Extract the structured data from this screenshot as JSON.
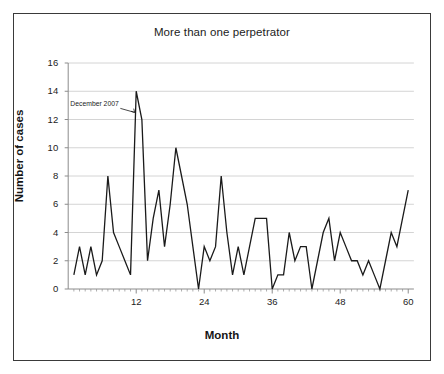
{
  "chart_data": {
    "type": "line",
    "title": "More than one perpetrator",
    "xlabel": "Month",
    "ylabel": "Number of cases",
    "xlim": [
      0,
      61
    ],
    "ylim": [
      0,
      16
    ],
    "xticks": [
      12,
      24,
      36,
      48,
      60
    ],
    "xtick_labels": [
      "12",
      "24",
      "36",
      "48",
      "60"
    ],
    "yticks": [
      0,
      2,
      4,
      6,
      8,
      10,
      12,
      14,
      16
    ],
    "ytick_labels": [
      "0",
      "2",
      "4",
      "6",
      "8",
      "10",
      "12",
      "14",
      "16"
    ],
    "grid": "horizontal",
    "legend": "none",
    "line_color": "#1a1a1a",
    "grid_color": "#c9c9c9",
    "axis_color": "#8c8c8c",
    "frame_color": "#3a3a3a",
    "x": [
      1,
      2,
      3,
      4,
      5,
      6,
      7,
      8,
      9,
      10,
      11,
      12,
      13,
      14,
      15,
      16,
      17,
      18,
      19,
      20,
      21,
      22,
      23,
      24,
      25,
      26,
      27,
      28,
      29,
      30,
      31,
      32,
      33,
      34,
      35,
      36,
      37,
      38,
      39,
      40,
      41,
      42,
      43,
      44,
      45,
      46,
      47,
      48,
      49,
      50,
      51,
      52,
      53,
      54,
      55,
      56,
      57,
      58,
      59,
      60
    ],
    "values": [
      1,
      3,
      1,
      3,
      1,
      2,
      8,
      4,
      3,
      2,
      1,
      14,
      12,
      2,
      5,
      7,
      3,
      6,
      10,
      8,
      6,
      3,
      0,
      3,
      2,
      3,
      8,
      4,
      1,
      3,
      1,
      3,
      5,
      5,
      5,
      0,
      1,
      1,
      4,
      2,
      3,
      3,
      0,
      2,
      4,
      5,
      2,
      4,
      3,
      2,
      2,
      1,
      2,
      1,
      0,
      2,
      4,
      3,
      5,
      7
    ],
    "annotations": [
      {
        "text": "December 2007",
        "target_x": 12,
        "target_y": 12.5,
        "label_x": 2.5,
        "label_y": 13.0
      }
    ]
  },
  "axes": {
    "title": "More than one perpetrator",
    "x_axis_title": "Month",
    "y_axis_title": "Number of cases"
  }
}
